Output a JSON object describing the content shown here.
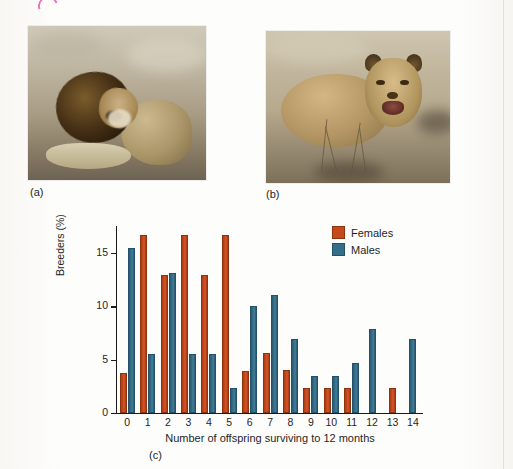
{
  "figure": {
    "panel_a_label": "(a)",
    "panel_b_label": "(b)",
    "panel_c_label": "(c)",
    "photo_a_alt": "male-lion-resting",
    "photo_b_alt": "lioness-resting"
  },
  "colors": {
    "females": "#c6491a",
    "males": "#356e89",
    "axis": "#1b1b1b",
    "page_background": "#fdfdfc",
    "annotation_pink": "#e06ab4"
  },
  "legend": {
    "position": "top-right",
    "items": [
      {
        "label": "Females",
        "color_key": "females"
      },
      {
        "label": "Males",
        "color_key": "males"
      }
    ]
  },
  "chart_data": {
    "type": "bar",
    "title": "",
    "xlabel": "Number of offspring surviving to 12 months",
    "ylabel": "Breeders (%)",
    "categories": [
      "0",
      "1",
      "2",
      "3",
      "4",
      "5",
      "6",
      "7",
      "8",
      "9",
      "10",
      "11",
      "12",
      "13",
      "14"
    ],
    "ylim": [
      0,
      17.5
    ],
    "yticks": [
      0,
      5,
      10,
      15
    ],
    "ytick_labels": [
      "0",
      "5",
      "10",
      "15"
    ],
    "grid": false,
    "series": [
      {
        "name": "Females",
        "color": "#c6491a",
        "values": [
          3.7,
          16.7,
          12.9,
          16.7,
          12.9,
          16.7,
          3.9,
          5.6,
          4.0,
          2.3,
          2.3,
          2.3,
          0,
          2.3,
          0
        ]
      },
      {
        "name": "Males",
        "color": "#356e89",
        "values": [
          15.4,
          5.5,
          13.1,
          5.5,
          5.5,
          2.3,
          10.0,
          11.0,
          6.9,
          3.5,
          3.5,
          4.7,
          7.9,
          0,
          6.9
        ]
      }
    ]
  }
}
